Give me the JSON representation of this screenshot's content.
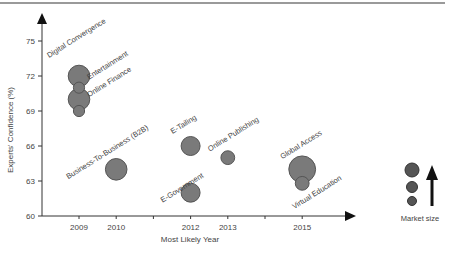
{
  "chart_data": {
    "type": "scatter",
    "subtype": "bubble",
    "title": "",
    "xlabel": "Most Likely Year",
    "ylabel": "Experts' Confidence (%)",
    "xlim": [
      2008.2,
      2016.2
    ],
    "ylim": [
      60,
      76.5
    ],
    "xticks": [
      2009,
      2010,
      2012,
      2013,
      2015
    ],
    "xminor_ticks": [
      2011,
      2014
    ],
    "yticks": [
      60,
      63,
      66,
      69,
      72,
      75
    ],
    "grid": false,
    "points": [
      {
        "label": "Digital Convergence",
        "x": 2009,
        "y": 72,
        "size": 3
      },
      {
        "label": "Entertainment",
        "x": 2009,
        "y": 71,
        "size": 1
      },
      {
        "label": "Online Finance",
        "x": 2009,
        "y": 70,
        "size": 3
      },
      {
        "label": "",
        "x": 2009,
        "y": 69,
        "size": 1
      },
      {
        "label": "Business-To-Business (B2B)",
        "x": 2010,
        "y": 64,
        "size": 3
      },
      {
        "label": "E-Tailing",
        "x": 2012,
        "y": 66,
        "size": 2.5
      },
      {
        "label": "E-Government",
        "x": 2012,
        "y": 62,
        "size": 2.5
      },
      {
        "label": "Online Publishing",
        "x": 2013,
        "y": 65,
        "size": 1.5
      },
      {
        "label": "Global Access",
        "x": 2015,
        "y": 64,
        "size": 4
      },
      {
        "label": "Virtual Education",
        "x": 2015,
        "y": 62.8,
        "size": 1.5
      }
    ],
    "legend": {
      "title": "Market size",
      "placement": "right",
      "sizes": [
        3,
        2.5,
        2
      ]
    },
    "colors": {
      "bubble_fill": "#7a7a7a",
      "bubble_stroke": "#555555",
      "axis": "#333333",
      "text": "#444444"
    }
  }
}
